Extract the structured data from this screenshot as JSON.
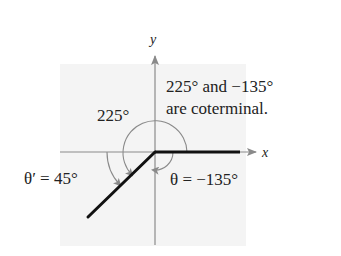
{
  "diagram": {
    "axes": {
      "x_label": "x",
      "y_label": "y"
    },
    "labels": {
      "angle_225": "225°",
      "note_line1": "225° and −135°",
      "note_line2": "are coterminal.",
      "reference_angle": "θ′ = 45°",
      "theta": "θ = −135°"
    },
    "angles": {
      "positive_deg": 225,
      "negative_deg": -135,
      "reference_deg": 45
    },
    "colors": {
      "background_panel": "#f4f4f4",
      "axis": "#8a8a8a",
      "arc": "#8a8a8a",
      "terminal_side": "#111111",
      "text": "#222222"
    }
  }
}
